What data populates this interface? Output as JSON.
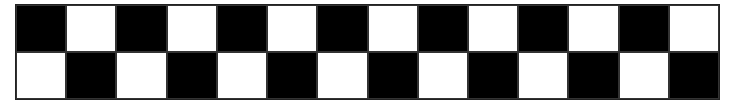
{
  "board": {
    "rows": 2,
    "columns": 14,
    "colors": {
      "dark": "#000000",
      "light": "#ffffff",
      "border": "#222222"
    },
    "cells": [
      [
        "black",
        "white",
        "black",
        "white",
        "black",
        "white",
        "black",
        "white",
        "black",
        "white",
        "black",
        "white",
        "black",
        "white"
      ],
      [
        "white",
        "black",
        "white",
        "black",
        "white",
        "black",
        "white",
        "black",
        "white",
        "black",
        "white",
        "black",
        "white",
        "black"
      ]
    ]
  }
}
